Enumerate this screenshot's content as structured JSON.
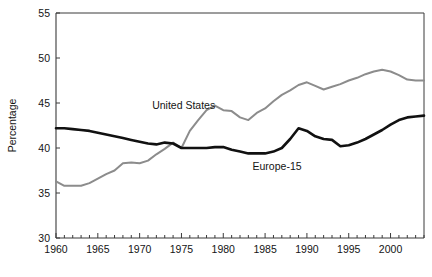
{
  "chart_data": {
    "type": "line",
    "title": "",
    "xlabel": "",
    "ylabel": "Percentage",
    "xlim": [
      1960,
      2004
    ],
    "ylim": [
      30,
      55
    ],
    "grid": false,
    "legend_position": "inline-annotations",
    "y_ticks": [
      30,
      35,
      40,
      45,
      50,
      55
    ],
    "x_ticks": [
      1960,
      1965,
      1970,
      1975,
      1980,
      1985,
      1990,
      1995,
      2000
    ],
    "x_minor_tick_step": 1,
    "x": [
      1960,
      1961,
      1962,
      1963,
      1964,
      1965,
      1966,
      1967,
      1968,
      1969,
      1970,
      1971,
      1972,
      1973,
      1974,
      1975,
      1976,
      1977,
      1978,
      1979,
      1980,
      1981,
      1982,
      1983,
      1984,
      1985,
      1986,
      1987,
      1988,
      1989,
      1990,
      1991,
      1992,
      1993,
      1994,
      1995,
      1996,
      1997,
      1998,
      1999,
      2000,
      2001,
      2002,
      2003,
      2004
    ],
    "series": [
      {
        "name": "United States",
        "color": "#8c8c8c",
        "line_width": 2.0,
        "label_x": 1971.5,
        "label_y": 44.3,
        "values": [
          36.3,
          35.8,
          35.8,
          35.8,
          36.1,
          36.6,
          37.1,
          37.5,
          38.3,
          38.4,
          38.3,
          38.6,
          39.3,
          39.9,
          40.6,
          40.0,
          41.9,
          43.1,
          44.2,
          44.7,
          44.2,
          44.1,
          43.4,
          43.1,
          43.9,
          44.4,
          45.2,
          45.9,
          46.4,
          47.0,
          47.3,
          46.9,
          46.5,
          46.8,
          47.1,
          47.5,
          47.8,
          48.2,
          48.5,
          48.7,
          48.5,
          48.1,
          47.6,
          47.5,
          47.5
        ]
      },
      {
        "name": "Europe-15",
        "color": "#111111",
        "line_width": 2.6,
        "label_x": 1983.5,
        "label_y": 37.6,
        "values": [
          42.2,
          42.2,
          42.1,
          42.0,
          41.9,
          41.7,
          41.5,
          41.3,
          41.1,
          40.9,
          40.7,
          40.5,
          40.4,
          40.6,
          40.5,
          40.0,
          40.0,
          40.0,
          40.0,
          40.1,
          40.1,
          39.8,
          39.6,
          39.4,
          39.4,
          39.4,
          39.6,
          40.0,
          41.0,
          42.2,
          41.9,
          41.3,
          41.0,
          40.9,
          40.2,
          40.3,
          40.6,
          41.0,
          41.5,
          42.0,
          42.6,
          43.1,
          43.4,
          43.5,
          43.6
        ]
      }
    ]
  }
}
